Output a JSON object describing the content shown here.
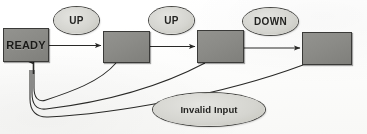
{
  "diagram": {
    "type": "state-machine",
    "background_color": "#fbfbfa",
    "state_fill_color": "#8b8b87",
    "state_border_color": "#3b3b39",
    "transition_fill_color": "#d3d3ce",
    "transition_border_color": "#4a4a47",
    "arrow_color": "#2b2b29"
  },
  "states": [
    {
      "id": "s0",
      "label": "READY",
      "x": 3,
      "y": 28,
      "w": 46,
      "h": 34
    },
    {
      "id": "s1",
      "label": "",
      "x": 103,
      "y": 31,
      "w": 47,
      "h": 32
    },
    {
      "id": "s2",
      "label": "",
      "x": 197,
      "y": 30,
      "w": 47,
      "h": 33
    },
    {
      "id": "s3",
      "label": "",
      "x": 302,
      "y": 32,
      "w": 50,
      "h": 33
    }
  ],
  "transitions": [
    {
      "id": "t0",
      "label": "UP",
      "x": 54,
      "y": 7,
      "w": 45,
      "h": 27,
      "from": "s0",
      "to": "s1"
    },
    {
      "id": "t1",
      "label": "UP",
      "x": 149,
      "y": 7,
      "w": 45,
      "h": 27,
      "from": "s1",
      "to": "s2"
    },
    {
      "id": "t2",
      "label": "DOWN",
      "x": 243,
      "y": 8,
      "w": 55,
      "h": 27,
      "from": "s2",
      "to": "s3"
    },
    {
      "id": "t3",
      "label": "Invalid Input",
      "x": 153,
      "y": 93,
      "w": 112,
      "h": 33,
      "from": "all",
      "to": "s0"
    }
  ],
  "edges": [
    {
      "id": "e0",
      "kind": "forward",
      "from": "s0",
      "to": "s1",
      "label_ref": "t0"
    },
    {
      "id": "e1",
      "kind": "forward",
      "from": "s1",
      "to": "s2",
      "label_ref": "t1"
    },
    {
      "id": "e2",
      "kind": "forward",
      "from": "s2",
      "to": "s3",
      "label_ref": "t2"
    },
    {
      "id": "e3",
      "kind": "return",
      "from": "s1",
      "to": "s0",
      "label_ref": "t3"
    },
    {
      "id": "e4",
      "kind": "return",
      "from": "s2",
      "to": "s0",
      "label_ref": "t3"
    },
    {
      "id": "e5",
      "kind": "return",
      "from": "s3",
      "to": "s0",
      "label_ref": "t3"
    }
  ]
}
